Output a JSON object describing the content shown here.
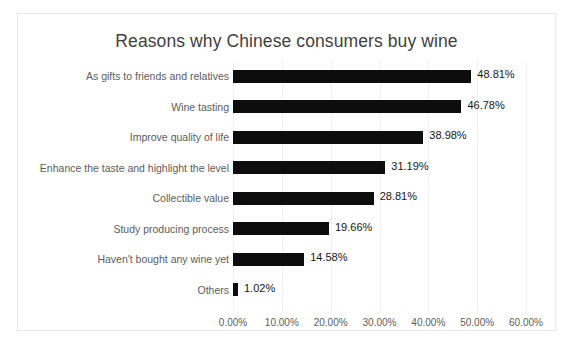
{
  "chart_data": {
    "type": "bar",
    "orientation": "horizontal",
    "title": "Reasons why Chinese consumers buy wine",
    "xlabel": "",
    "ylabel": "",
    "xlim": [
      0,
      60
    ],
    "grid": true,
    "legend": "none",
    "tick_labels": [
      "0.00%",
      "10.00%",
      "20.00%",
      "30.00%",
      "40.00%",
      "50.00%",
      "60.00%"
    ],
    "tick_values": [
      0,
      10,
      20,
      30,
      40,
      50,
      60
    ],
    "categories": [
      "As gifts to friends and relatives",
      "Wine tasting",
      "Improve quality of life",
      "Enhance the taste and highlight the level",
      "Collectible value",
      "Study producing process",
      "Haven't bought any wine yet",
      "Others"
    ],
    "values": [
      48.81,
      46.78,
      38.98,
      31.19,
      28.81,
      19.66,
      14.58,
      1.02
    ],
    "value_labels": [
      "48.81%",
      "46.78%",
      "38.98%",
      "31.19%",
      "28.81%",
      "19.66%",
      "14.58%",
      "1.02%"
    ],
    "bar_color": "#0d0d0d",
    "title_color": "#3f3f3f",
    "label_color": "#5c5c5c",
    "value_color": "#161616",
    "grid_color": "#f0f0f0",
    "background": "#ffffff",
    "border_color": "#e9e9e9"
  }
}
